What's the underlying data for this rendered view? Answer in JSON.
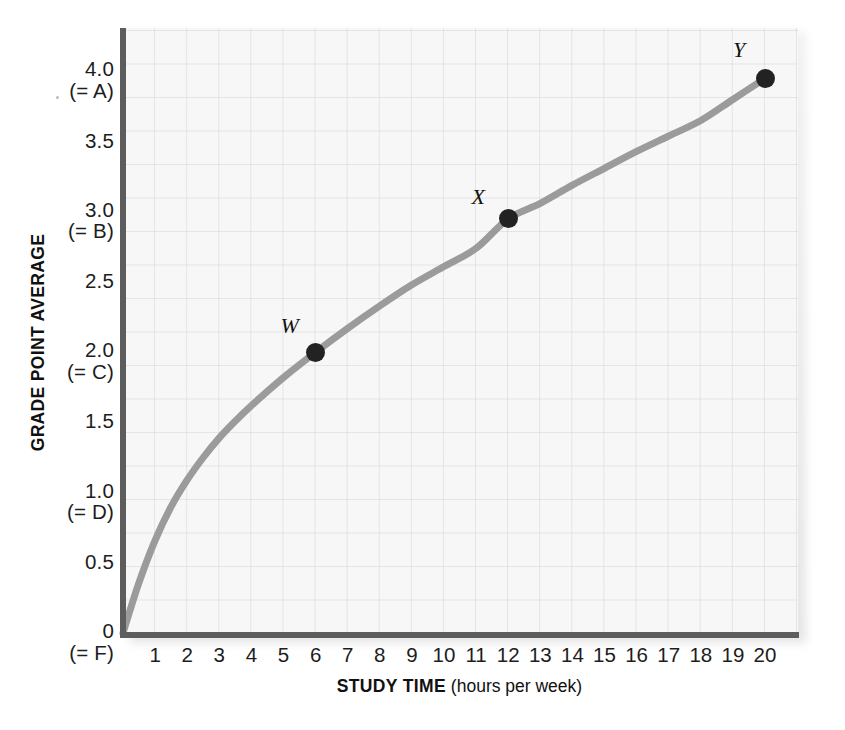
{
  "chart_data": {
    "type": "line",
    "title": "",
    "subtitle": "",
    "xlabel_bold": "STUDY TIME",
    "xlabel_regular": "(hours per week)",
    "ylabel": "GRADE POINT AVERAGE",
    "xlim": [
      0,
      20
    ],
    "ylim": [
      0,
      4.2
    ],
    "grid": true,
    "legend": "none",
    "x_ticks": [
      {
        "value": 1,
        "label": "1"
      },
      {
        "value": 2,
        "label": "2"
      },
      {
        "value": 3,
        "label": "3"
      },
      {
        "value": 4,
        "label": "4"
      },
      {
        "value": 5,
        "label": "5"
      },
      {
        "value": 6,
        "label": "6"
      },
      {
        "value": 7,
        "label": "7"
      },
      {
        "value": 8,
        "label": "8"
      },
      {
        "value": 9,
        "label": "9"
      },
      {
        "value": 10,
        "label": "10"
      },
      {
        "value": 11,
        "label": "11"
      },
      {
        "value": 12,
        "label": "12"
      },
      {
        "value": 13,
        "label": "13"
      },
      {
        "value": 14,
        "label": "14"
      },
      {
        "value": 15,
        "label": "15"
      },
      {
        "value": 16,
        "label": "16"
      },
      {
        "value": 17,
        "label": "17"
      },
      {
        "value": 18,
        "label": "18"
      },
      {
        "value": 19,
        "label": "19"
      },
      {
        "value": 20,
        "label": "20"
      }
    ],
    "y_ticks": [
      {
        "value": 4.0,
        "label": "4.0",
        "grade": "(= A)"
      },
      {
        "value": 3.5,
        "label": "3.5",
        "grade": ""
      },
      {
        "value": 3.0,
        "label": "3.0",
        "grade": "(= B)"
      },
      {
        "value": 2.5,
        "label": "2.5",
        "grade": ""
      },
      {
        "value": 2.0,
        "label": "2.0",
        "grade": "(= C)"
      },
      {
        "value": 1.5,
        "label": "1.5",
        "grade": ""
      },
      {
        "value": 1.0,
        "label": "1.0",
        "grade": "(= D)"
      },
      {
        "value": 0.5,
        "label": "0.5",
        "grade": ""
      },
      {
        "value": 0.0,
        "label": "0",
        "grade": "(= F)"
      }
    ],
    "series": [
      {
        "name": "GPA vs study time",
        "color": "#9b9b9b",
        "line_width": 7,
        "x": [
          0.0,
          0.5,
          1.0,
          1.5,
          2.0,
          2.5,
          3.0,
          3.5,
          4.0,
          5.0,
          6.0,
          7.0,
          8.0,
          9.0,
          10.0,
          11.0,
          12.0,
          13.0,
          14.0,
          15.0,
          16.0,
          17.0,
          18.0,
          19.0,
          20.0
        ],
        "y": [
          0.0,
          0.36,
          0.66,
          0.9,
          1.09,
          1.25,
          1.39,
          1.51,
          1.62,
          1.82,
          2.0,
          2.17,
          2.33,
          2.48,
          2.61,
          2.74,
          2.95,
          3.06,
          3.19,
          3.31,
          3.43,
          3.54,
          3.65,
          3.8,
          3.95
        ]
      }
    ],
    "annotated_points": [
      {
        "label": "W",
        "x": 6,
        "y": 2.0,
        "label_dx": -26,
        "label_dy": -26
      },
      {
        "label": "X",
        "x": 12,
        "y": 2.95,
        "label_dx": -30,
        "label_dy": -22
      },
      {
        "label": "Y",
        "x": 20,
        "y": 3.95,
        "label_dx": -26,
        "label_dy": -28
      }
    ]
  }
}
